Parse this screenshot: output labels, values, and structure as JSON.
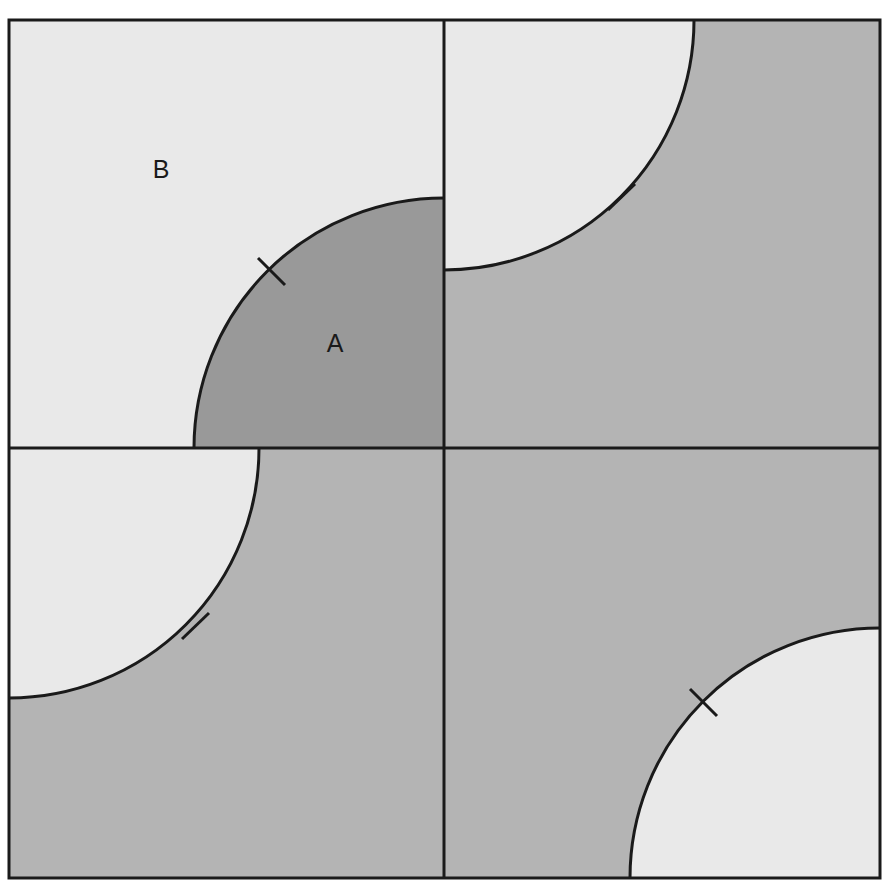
{
  "figure": {
    "frame": {
      "x": 9,
      "y": 20,
      "width": 871,
      "height": 858,
      "stroke": "#1a1a1a",
      "stroke_width": 3
    },
    "center": {
      "x": 444,
      "y": 448
    },
    "arc_radius": 250,
    "colors": {
      "light": "#e9e9e9",
      "medium": "#b4b4b4",
      "dark": "#999999",
      "line": "#1a1a1a",
      "background": "#ffffff"
    },
    "divider_lines": {
      "vertical_x": 444,
      "horizontal_y": 448,
      "stroke": "#1a1a1a",
      "stroke_width": 3
    }
  },
  "quadrants": [
    {
      "id": "top-left",
      "field_color": "#e9e9e9",
      "disc_color": "#999999",
      "disc_corner": "bottom-right",
      "disc_center": {
        "x": 444,
        "y": 448
      },
      "radius": 250
    },
    {
      "id": "top-right",
      "field_color": "#b4b4b4",
      "disc_color": "#e9e9e9",
      "disc_corner": "top-left",
      "disc_center": {
        "x": 444,
        "y": 20
      },
      "radius": 250
    },
    {
      "id": "bottom-left",
      "field_color": "#b4b4b4",
      "disc_color": "#e9e9e9",
      "disc_corner": "top-left",
      "disc_center": {
        "x": 9,
        "y": 448
      },
      "radius": 250
    },
    {
      "id": "bottom-right",
      "field_color": "#b4b4b4",
      "disc_color": "#e9e9e9",
      "disc_corner": "bottom-right",
      "disc_center": {
        "x": 880,
        "y": 878
      },
      "radius": 250
    }
  ],
  "labels": {
    "region_a": {
      "text": "A",
      "x": 335,
      "y": 345
    },
    "region_b": {
      "text": "B",
      "x": 161,
      "y": 171
    }
  },
  "tick_marks": [
    {
      "id": "tick-top-left",
      "x": 271,
      "y": 271,
      "angle": 45,
      "length": 38
    },
    {
      "id": "tick-top-right",
      "x": 621,
      "y": 197,
      "angle": 135,
      "length": 38
    },
    {
      "id": "tick-bottom-left",
      "x": 195,
      "y": 626,
      "angle": 135,
      "length": 38
    },
    {
      "id": "tick-bottom-right",
      "x": 703,
      "y": 702,
      "angle": 45,
      "length": 38
    }
  ]
}
